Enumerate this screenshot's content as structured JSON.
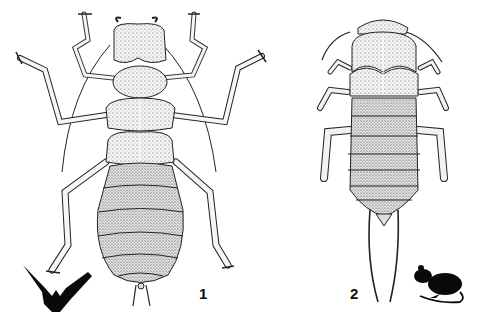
{
  "figure": {
    "type": "scientific-illustration",
    "background": "#ffffff",
    "ink_color": "#111111",
    "specimens": [
      {
        "label": "1",
        "description": "wingless parasitic insect, dorsal view, long legs and antennae",
        "host_silhouette": "bat-icon"
      },
      {
        "label": "2",
        "description": "flattened parasitic insect, dorsal view, two long caudal cerci",
        "host_silhouette": "mouse-icon"
      }
    ]
  }
}
